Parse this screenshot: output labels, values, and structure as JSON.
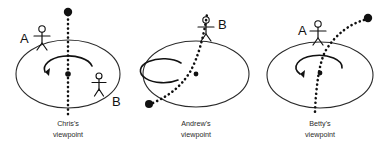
{
  "figure": {
    "background_color": "#ffffff",
    "ink_color": "#111111",
    "width": 392,
    "height": 144
  },
  "panels": [
    {
      "id": "chris",
      "caption_line1": "Chris's",
      "caption_line2": "viewpoint",
      "observer_name": "Chris",
      "disk": {
        "cx": 68,
        "cy": 74,
        "rx": 52,
        "ry": 34
      },
      "center_dot": {
        "cx": 68,
        "cy": 74,
        "r": 2.6
      },
      "rotation_arrow": "counterclockwise",
      "ball_path_type": "straight-vertical-dotted",
      "ball_marker": {
        "cx": 68,
        "cy": 12,
        "r": 4.2
      },
      "people": [
        {
          "letter": "A",
          "label_x": 23,
          "label_y": 40,
          "figure_x": 42,
          "figure_y": 34
        },
        {
          "letter": "B",
          "label_x": 115,
          "label_y": 105,
          "figure_x": 99,
          "figure_y": 80
        }
      ]
    },
    {
      "id": "andrew",
      "caption_line1": "Andrew's",
      "caption_line2": "viewpoint",
      "observer_name": "Andrew",
      "disk": {
        "cx": 196,
        "cy": 74,
        "rx": 53,
        "ry": 33
      },
      "center_dot": {
        "cx": 196,
        "cy": 74,
        "r": 2.4
      },
      "rotation_arrow": "none",
      "ball_path_type": "curved-dotted-from-lower-left-to-top",
      "ball_marker": {
        "cx": 149,
        "cy": 103,
        "r": 4.0
      },
      "people": [
        {
          "letter": "B",
          "label_x": 222,
          "label_y": 27,
          "figure_x": 206,
          "figure_y": 22
        }
      ]
    },
    {
      "id": "betty",
      "caption_line1": "Betty's",
      "caption_line2": "viewpoint",
      "observer_name": "Betty",
      "disk": {
        "cx": 320,
        "cy": 75,
        "rx": 53,
        "ry": 33
      },
      "center_dot": {
        "cx": 320,
        "cy": 73,
        "r": 2.4
      },
      "rotation_arrow": "counterclockwise",
      "ball_path_type": "curved-dotted-from-top-right-to-bottom",
      "ball_marker": {
        "cx": 368,
        "cy": 18,
        "r": 4.2
      },
      "people": [
        {
          "letter": "A",
          "label_x": 302,
          "label_y": 33,
          "figure_x": 318,
          "figure_y": 26
        }
      ]
    }
  ]
}
